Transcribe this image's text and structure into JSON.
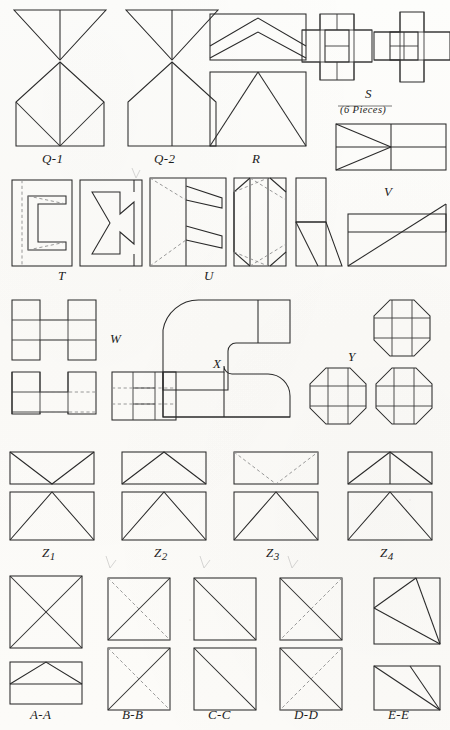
{
  "page": {
    "background_color": "#fdfdfb",
    "ink_color": "#2a2a2a",
    "dash_color": "#8d8d8d"
  },
  "figures": [
    {
      "id": "q1",
      "label": "Q-1",
      "row": 1,
      "col": 1,
      "pieces": null,
      "shapes": [
        "inverted-triangle-split",
        "pentagon-house-with-fan"
      ]
    },
    {
      "id": "q2",
      "label": "Q-2",
      "row": 1,
      "col": 2,
      "pieces": null,
      "shapes": [
        "inverted-triangle-split",
        "pentagon-house-with-centerline"
      ]
    },
    {
      "id": "r",
      "label": "R",
      "row": 1,
      "col": 3,
      "pieces": null,
      "shapes": [
        "rectangle-double-chevron",
        "square-with-tall-triangle"
      ]
    },
    {
      "id": "s",
      "label": "S",
      "row": 1,
      "col": 4,
      "pieces": "(6 Pieces)",
      "shapes": [
        "cross-subdivided-a",
        "cross-subdivided-b"
      ]
    },
    {
      "id": "t",
      "label": "T",
      "row": 2,
      "col": 1,
      "pieces": null,
      "shapes": [
        "rect-c-shape-dashed",
        "rect-c-shape-solid"
      ]
    },
    {
      "id": "u",
      "label": "U",
      "row": 2,
      "col": 2,
      "pieces": null,
      "shapes": [
        "square-zigzag-dashed",
        "square-banded-diagonals"
      ]
    },
    {
      "id": "v",
      "label": "V",
      "row": 2,
      "col": 3,
      "pieces": null,
      "shapes": [
        "tall-rect-with-trapezoid",
        "wide-rect-diagonal-band"
      ]
    },
    {
      "id": "w",
      "label": "W",
      "row": 3,
      "col": 1,
      "pieces": null,
      "shapes": [
        "h-block-solid",
        "h-block-dashed",
        "square-grid-dashed"
      ]
    },
    {
      "id": "x",
      "label": "X",
      "row": 3,
      "col": 2,
      "pieces": null,
      "shapes": [
        "elbow-curve-upper",
        "elbow-curve-lower"
      ]
    },
    {
      "id": "y",
      "label": "Y",
      "row": 3,
      "col": 3,
      "pieces": null,
      "shapes": [
        "octagon-grid-1",
        "octagon-grid-2",
        "octagon-grid-3"
      ]
    },
    {
      "id": "z1",
      "label": "Z1",
      "label_base": "Z",
      "label_sub": "1",
      "row": 4,
      "col": 1,
      "pieces": null,
      "shapes": [
        "rect-v-notch-solid",
        "rect-peak-triangle"
      ]
    },
    {
      "id": "z2",
      "label": "Z2",
      "label_base": "Z",
      "label_sub": "2",
      "row": 4,
      "col": 2,
      "pieces": null,
      "shapes": [
        "rect-peak-offset",
        "rect-peak-triangle"
      ]
    },
    {
      "id": "z3",
      "label": "Z3",
      "label_base": "Z",
      "label_sub": "3",
      "row": 4,
      "col": 3,
      "pieces": null,
      "shapes": [
        "rect-v-notch-dashed",
        "rect-peak-triangle"
      ]
    },
    {
      "id": "z4",
      "label": "Z4",
      "label_base": "Z",
      "label_sub": "4",
      "row": 4,
      "col": 4,
      "pieces": null,
      "shapes": [
        "rect-peak-centerline",
        "rect-peak-triangle"
      ]
    },
    {
      "id": "aa",
      "label": "A-A",
      "row": 5,
      "col": 1,
      "pieces": null,
      "shapes": [
        "square-full-x",
        "rect-low-peak-band"
      ]
    },
    {
      "id": "bb",
      "label": "B-B",
      "row": 5,
      "col": 2,
      "pieces": null,
      "shapes": [
        "square-x-one-dashed",
        "square-x-one-dashed"
      ]
    },
    {
      "id": "cc",
      "label": "C-C",
      "row": 5,
      "col": 3,
      "pieces": null,
      "shapes": [
        "square-single-diagonal",
        "square-single-diagonal"
      ]
    },
    {
      "id": "dd",
      "label": "D-D",
      "row": 5,
      "col": 4,
      "pieces": null,
      "shapes": [
        "square-x-one-dashed",
        "square-x-one-dashed"
      ]
    },
    {
      "id": "ee",
      "label": "E-E",
      "row": 5,
      "col": 5,
      "pieces": null,
      "shapes": [
        "square-two-rays",
        "rect-two-rays"
      ]
    }
  ],
  "labels": {
    "q1": "Q-1",
    "q2": "Q-2",
    "r": "R",
    "s": "S",
    "s_pieces": "(6 Pieces)",
    "t": "T",
    "u": "U",
    "v": "V",
    "w": "W",
    "x": "X",
    "y": "Y",
    "z1_base": "Z",
    "z1_sub": "1",
    "z2_base": "Z",
    "z2_sub": "2",
    "z3_base": "Z",
    "z3_sub": "3",
    "z4_base": "Z",
    "z4_sub": "4",
    "aa": "A-A",
    "bb": "B-B",
    "cc": "C-C",
    "dd": "D-D",
    "ee": "E-E"
  }
}
